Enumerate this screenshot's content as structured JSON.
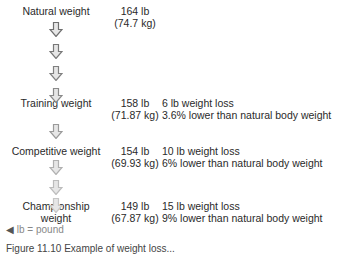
{
  "stages": [
    {
      "label": "Natural weight",
      "lb": "164 lb",
      "kg": "(74.7 kg)",
      "loss": "",
      "pct": ""
    },
    {
      "label": "Training weight",
      "lb": "158 lb",
      "kg": "(71.87 kg)",
      "loss": "6 lb weight loss",
      "pct": "3.6% lower than natural body weight"
    },
    {
      "label": "Competitive weight",
      "lb": "154 lb",
      "kg": "(69.93 kg)",
      "loss": "10 lb weight loss",
      "pct": "6% lower than natural body weight"
    },
    {
      "label_line1": "Championship",
      "label_line2": "weight",
      "lb": "149 lb",
      "kg": "(67.87 kg)",
      "loss": "15 lb weight loss",
      "pct": "9% lower than natural body weight"
    }
  ],
  "arrows": [
    {
      "y": 22,
      "color": "#6f6f6f"
    },
    {
      "y": 44,
      "color": "#787878"
    },
    {
      "y": 66,
      "color": "#808080"
    },
    {
      "y": 88,
      "color": "#8a8a8a"
    },
    {
      "y": 124,
      "color": "#9a9a9a"
    },
    {
      "y": 160,
      "color": "#b0b0b0"
    },
    {
      "y": 180,
      "color": "#bcbcbc"
    },
    {
      "y": 198,
      "color": "#c6c6c6"
    }
  ],
  "footnote": {
    "icon": "triangle-left-icon",
    "text": "lb = pound"
  },
  "caption": "Figure 11.10  Example of weight loss..."
}
